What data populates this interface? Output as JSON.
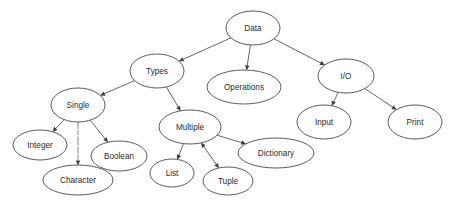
{
  "diagram": {
    "title": "Data",
    "type": "concept-map-tree",
    "background_color": "#ffffff",
    "node_fill_color": "#ffffff",
    "node_stroke_color": "#4a4a4a",
    "edge_color": "#555555",
    "label_color": "#2b2b2b",
    "nodes": [
      {
        "id": "data",
        "label": "Data",
        "cx": 253,
        "cy": 28,
        "rx": 27,
        "ry": 17
      },
      {
        "id": "types",
        "label": "Types",
        "cx": 157,
        "cy": 71,
        "rx": 27,
        "ry": 17
      },
      {
        "id": "operations",
        "label": "Operations",
        "cx": 244,
        "cy": 87,
        "rx": 37,
        "ry": 17
      },
      {
        "id": "io",
        "label": "I/O",
        "cx": 346,
        "cy": 76,
        "rx": 28,
        "ry": 17
      },
      {
        "id": "single",
        "label": "Single",
        "cx": 78,
        "cy": 105,
        "rx": 27,
        "ry": 17
      },
      {
        "id": "multiple",
        "label": "Multiple",
        "cx": 190,
        "cy": 127,
        "rx": 31,
        "ry": 17
      },
      {
        "id": "input",
        "label": "Input",
        "cx": 324,
        "cy": 122,
        "rx": 27,
        "ry": 17
      },
      {
        "id": "print",
        "label": "Print",
        "cx": 415,
        "cy": 122,
        "rx": 27,
        "ry": 17
      },
      {
        "id": "integer",
        "label": "Integer",
        "cx": 40,
        "cy": 145,
        "rx": 27,
        "ry": 15
      },
      {
        "id": "boolean",
        "label": "Boolean",
        "cx": 119,
        "cy": 156,
        "rx": 28,
        "ry": 15
      },
      {
        "id": "character",
        "label": "Character",
        "cx": 78,
        "cy": 180,
        "rx": 35,
        "ry": 15
      },
      {
        "id": "dictionary",
        "label": "Dictionary",
        "cx": 276,
        "cy": 153,
        "rx": 38,
        "ry": 15
      },
      {
        "id": "list",
        "label": "List",
        "cx": 172,
        "cy": 173,
        "rx": 22,
        "ry": 14
      },
      {
        "id": "tuple",
        "label": "Tuple",
        "cx": 228,
        "cy": 181,
        "rx": 25,
        "ry": 14
      }
    ],
    "edges": [
      {
        "from": "data",
        "to": "types",
        "style": "solid",
        "arrow": "end"
      },
      {
        "from": "data",
        "to": "operations",
        "style": "solid",
        "arrow": "end"
      },
      {
        "from": "data",
        "to": "io",
        "style": "solid",
        "arrow": "end"
      },
      {
        "from": "types",
        "to": "single",
        "style": "solid",
        "arrow": "end"
      },
      {
        "from": "types",
        "to": "multiple",
        "style": "solid",
        "arrow": "end"
      },
      {
        "from": "single",
        "to": "integer",
        "style": "solid",
        "arrow": "end"
      },
      {
        "from": "single",
        "to": "character",
        "style": "faint",
        "arrow": "end"
      },
      {
        "from": "single",
        "to": "boolean",
        "style": "solid",
        "arrow": "end"
      },
      {
        "from": "multiple",
        "to": "list",
        "style": "solid",
        "arrow": "end"
      },
      {
        "from": "multiple",
        "to": "tuple",
        "style": "solid",
        "arrow": "both"
      },
      {
        "from": "multiple",
        "to": "dictionary",
        "style": "solid",
        "arrow": "end"
      },
      {
        "from": "io",
        "to": "input",
        "style": "solid",
        "arrow": "end"
      },
      {
        "from": "io",
        "to": "print",
        "style": "solid",
        "arrow": "end"
      }
    ]
  }
}
